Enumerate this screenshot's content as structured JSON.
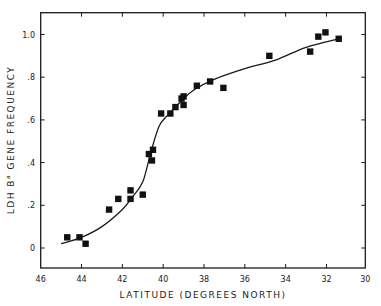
{
  "chart_data": {
    "type": "scatter",
    "title": "",
    "xlabel": "LATITUDE (DEGREES NORTH)",
    "ylabel": "LDH B",
    "ylabel_superscript": "a",
    "ylabel_suffix": "GENE FREQUENCY",
    "xlim": [
      46,
      30
    ],
    "x_reversed": true,
    "ylim": [
      -0.1,
      1.1
    ],
    "xticks": [
      46,
      44,
      42,
      40,
      38,
      36,
      34,
      32,
      30
    ],
    "yticks": [
      0,
      0.2,
      0.4,
      0.6,
      0.8,
      1.0
    ],
    "ytick_labels": [
      "0",
      ".2",
      ".4",
      ".6",
      ".8",
      "1.0"
    ],
    "grid": false,
    "legend": null,
    "marker": "square",
    "series": [
      {
        "name": "observed",
        "points": [
          {
            "x": 44.7,
            "y": 0.05
          },
          {
            "x": 44.1,
            "y": 0.05
          },
          {
            "x": 43.8,
            "y": 0.02
          },
          {
            "x": 42.65,
            "y": 0.18
          },
          {
            "x": 42.2,
            "y": 0.23
          },
          {
            "x": 41.6,
            "y": 0.27
          },
          {
            "x": 41.6,
            "y": 0.23
          },
          {
            "x": 41.0,
            "y": 0.25
          },
          {
            "x": 40.7,
            "y": 0.44
          },
          {
            "x": 40.5,
            "y": 0.46
          },
          {
            "x": 40.55,
            "y": 0.41
          },
          {
            "x": 40.1,
            "y": 0.63
          },
          {
            "x": 39.65,
            "y": 0.63
          },
          {
            "x": 39.4,
            "y": 0.66
          },
          {
            "x": 39.1,
            "y": 0.7
          },
          {
            "x": 39.0,
            "y": 0.71
          },
          {
            "x": 39.0,
            "y": 0.67
          },
          {
            "x": 38.35,
            "y": 0.76
          },
          {
            "x": 37.7,
            "y": 0.78
          },
          {
            "x": 37.05,
            "y": 0.75
          },
          {
            "x": 34.8,
            "y": 0.9
          },
          {
            "x": 32.8,
            "y": 0.92
          },
          {
            "x": 32.4,
            "y": 0.99
          },
          {
            "x": 32.05,
            "y": 1.01
          },
          {
            "x": 31.4,
            "y": 0.98
          }
        ]
      },
      {
        "name": "fitted curve",
        "type": "line",
        "points": [
          {
            "x": 45.0,
            "y": 0.02
          },
          {
            "x": 44.0,
            "y": 0.05
          },
          {
            "x": 43.0,
            "y": 0.1
          },
          {
            "x": 42.0,
            "y": 0.18
          },
          {
            "x": 41.5,
            "y": 0.24
          },
          {
            "x": 41.0,
            "y": 0.31
          },
          {
            "x": 40.6,
            "y": 0.45
          },
          {
            "x": 40.2,
            "y": 0.57
          },
          {
            "x": 39.8,
            "y": 0.62
          },
          {
            "x": 39.1,
            "y": 0.69
          },
          {
            "x": 38.5,
            "y": 0.74
          },
          {
            "x": 37.5,
            "y": 0.79
          },
          {
            "x": 36.0,
            "y": 0.84
          },
          {
            "x": 34.5,
            "y": 0.88
          },
          {
            "x": 33.0,
            "y": 0.94
          },
          {
            "x": 31.4,
            "y": 0.98
          }
        ]
      }
    ]
  }
}
